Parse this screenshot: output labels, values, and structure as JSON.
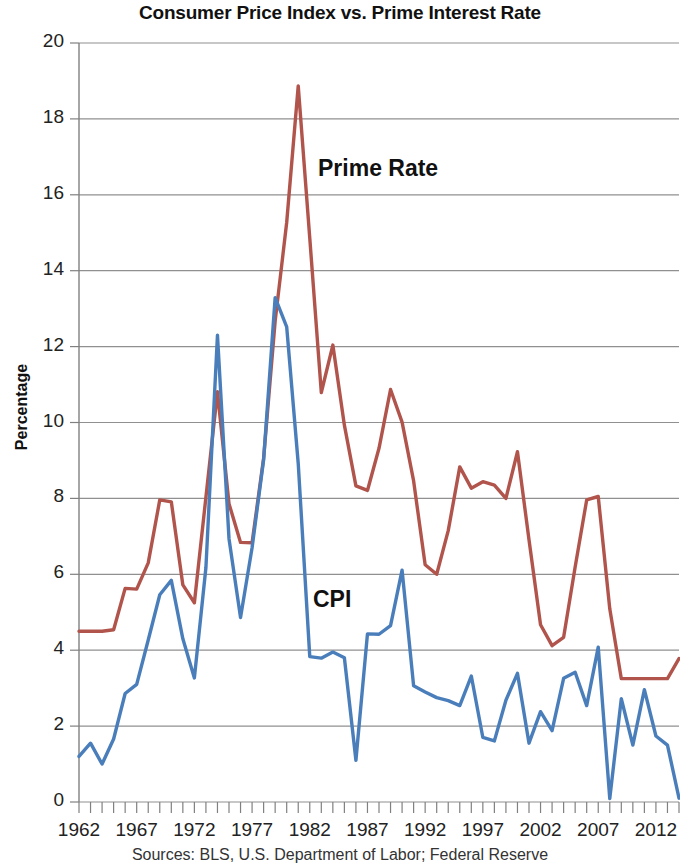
{
  "chart_data": {
    "type": "line",
    "title": "Consumer Price Index vs. Prime Interest Rate",
    "xlabel": "",
    "ylabel": "Percentage",
    "ylim": [
      0,
      20
    ],
    "ytick_step": 2,
    "yticks": [
      0,
      2,
      4,
      6,
      8,
      10,
      12,
      14,
      16,
      18,
      20
    ],
    "xlim": [
      1962,
      2014
    ],
    "xticks": [
      1962,
      1967,
      1972,
      1977,
      1982,
      1987,
      1992,
      1997,
      2002,
      2007,
      2012
    ],
    "xtick_labels": [
      "1962",
      "1967",
      "1972",
      "1977",
      "1982",
      "1987",
      "1992",
      "1997",
      "2002",
      "2007",
      "2012"
    ],
    "grid": "horizontal",
    "legend_position": "inline-annotations",
    "x": [
      1962,
      1963,
      1964,
      1965,
      1966,
      1967,
      1968,
      1969,
      1970,
      1971,
      1972,
      1973,
      1974,
      1975,
      1976,
      1977,
      1978,
      1979,
      1980,
      1981,
      1982,
      1983,
      1984,
      1985,
      1986,
      1987,
      1988,
      1989,
      1990,
      1991,
      1992,
      1993,
      1994,
      1995,
      1996,
      1997,
      1998,
      1999,
      2000,
      2001,
      2002,
      2003,
      2004,
      2005,
      2006,
      2007,
      2008,
      2009,
      2010,
      2011,
      2012,
      2013,
      2014
    ],
    "series": [
      {
        "name": "Prime Rate",
        "color": "#b0544c",
        "values": [
          4.5,
          4.5,
          4.5,
          4.54,
          5.63,
          5.61,
          6.3,
          7.96,
          7.91,
          5.72,
          5.25,
          8.03,
          10.81,
          7.86,
          6.84,
          6.83,
          9.06,
          12.67,
          15.27,
          18.87,
          14.86,
          10.79,
          12.04,
          9.93,
          8.33,
          8.21,
          9.32,
          10.87,
          10.01,
          8.46,
          6.25,
          6.0,
          7.15,
          8.83,
          8.27,
          8.44,
          8.35,
          8.0,
          9.23,
          6.91,
          4.67,
          4.12,
          4.34,
          6.19,
          7.96,
          8.05,
          5.09,
          3.25,
          3.25,
          3.25,
          3.25,
          3.25,
          3.78
        ]
      },
      {
        "name": "CPI",
        "color": "#4a7ebb",
        "values": [
          1.2,
          1.55,
          1.0,
          1.66,
          2.86,
          3.1,
          4.27,
          5.46,
          5.84,
          4.3,
          3.27,
          6.18,
          12.3,
          6.94,
          4.86,
          6.7,
          9.02,
          13.29,
          12.52,
          8.92,
          3.83,
          3.79,
          3.95,
          3.8,
          1.1,
          4.43,
          4.42,
          4.65,
          6.11,
          3.06,
          2.9,
          2.75,
          2.67,
          2.54,
          3.32,
          1.7,
          1.61,
          2.68,
          3.39,
          1.55,
          2.38,
          1.88,
          3.26,
          3.42,
          2.54,
          4.08,
          0.09,
          2.72,
          1.5,
          2.96,
          1.74,
          1.5,
          0.1
        ]
      }
    ]
  },
  "labels": {
    "prime": "Prime Rate",
    "cpi": "CPI"
  },
  "caption": "Sources: BLS, U.S. Department of Labor; Federal Reserve"
}
